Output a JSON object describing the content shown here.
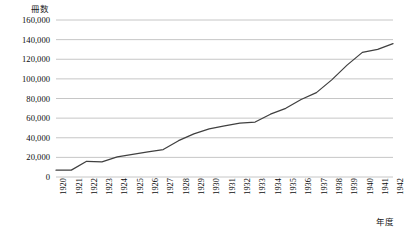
{
  "chart_data": {
    "type": "line",
    "title": "",
    "ylabel": "冊数",
    "xlabel": "年度",
    "ylim": [
      0,
      160000
    ],
    "ytick_step": 20000,
    "ytick_labels": [
      "160,000",
      "140,000",
      "120,000",
      "100,000",
      "80,000",
      "60,000",
      "40,000",
      "20,000",
      "0"
    ],
    "ytick_values": [
      160000,
      140000,
      120000,
      100000,
      80000,
      60000,
      40000,
      20000,
      0
    ],
    "grid": true,
    "legend": "none",
    "line_color": "#404040",
    "grid_color": "#bfbfbf",
    "categories": [
      "1920",
      "1921",
      "1922",
      "1923",
      "1924",
      "1925",
      "1926",
      "1927",
      "1928",
      "1929",
      "1930",
      "1931",
      "1932",
      "1933",
      "1934",
      "1935",
      "1936",
      "1937",
      "1938",
      "1939",
      "1940",
      "1941",
      "1942"
    ],
    "values": [
      7000,
      7000,
      16000,
      15500,
      20500,
      23000,
      25500,
      28000,
      37000,
      44000,
      49000,
      52000,
      55000,
      56000,
      64000,
      70000,
      79000,
      86000,
      99000,
      114000,
      127000,
      130000,
      136000
    ],
    "series": [
      {
        "name": "冊数",
        "values": [
          7000,
          7000,
          16000,
          15500,
          20500,
          23000,
          25500,
          28000,
          37000,
          44000,
          49000,
          52000,
          55000,
          56000,
          64000,
          70000,
          79000,
          86000,
          99000,
          114000,
          127000,
          130000,
          136000
        ]
      }
    ]
  }
}
